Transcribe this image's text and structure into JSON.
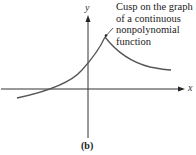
{
  "figure": {
    "caption": "(b)",
    "axes": {
      "x_label": "x",
      "y_label": "y"
    },
    "annotation": {
      "lines": [
        "Cusp on the graph",
        "of a continuous",
        "nonpolynomial",
        "function"
      ]
    },
    "colors": {
      "curve": "#555555",
      "axes": "#333333",
      "text": "#222222"
    }
  }
}
